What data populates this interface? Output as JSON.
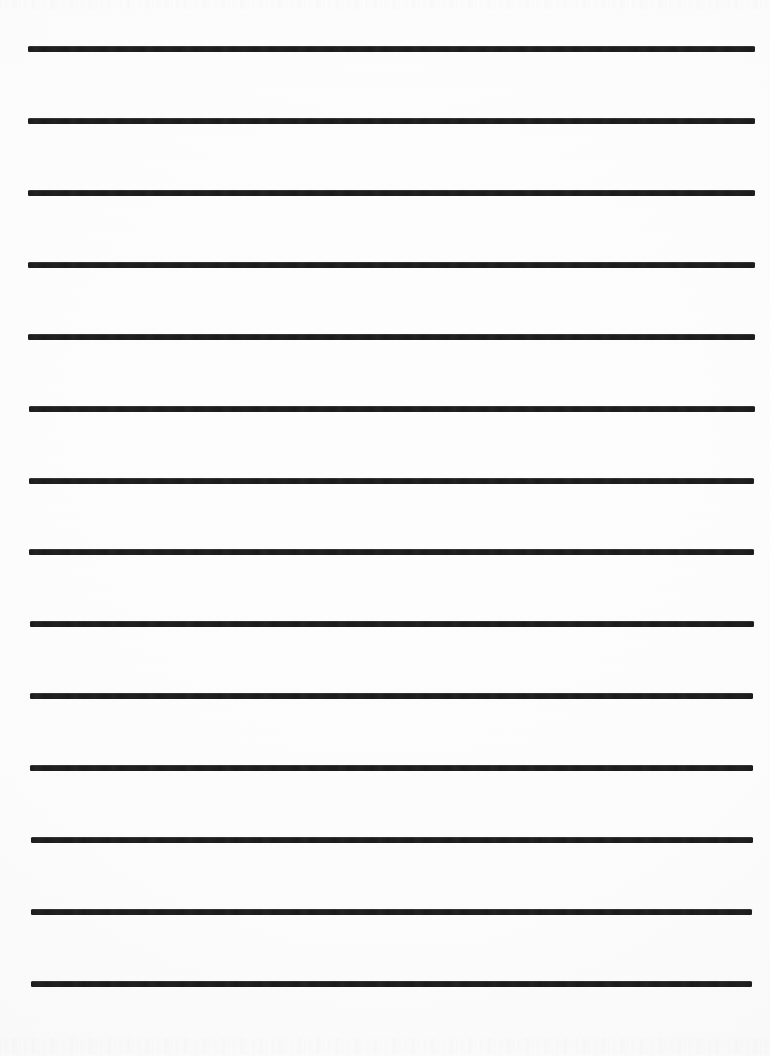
{
  "document": {
    "kind": "scanned-ruled-practice-paper",
    "title": "Ruled Practice Paper",
    "orientation": "portrait",
    "page_width": 770,
    "page_height": 1056,
    "background_color": "#fcfcfc",
    "ink_color": "#1c1c1c",
    "visible_text": "",
    "rule_count": 14,
    "rule_style": "wide-ruled solid horizontal lines",
    "rule_left_x": 28,
    "rule_right_x": 755,
    "rule_spacing_px": 72,
    "rule_thickness_px": 6
  },
  "rules": [
    {
      "index": 1,
      "label": "rule-line-1",
      "y": 46,
      "left": 28,
      "width": 727,
      "height": 6
    },
    {
      "index": 2,
      "label": "rule-line-2",
      "y": 118,
      "left": 28,
      "width": 727,
      "height": 6
    },
    {
      "index": 3,
      "label": "rule-line-3",
      "y": 190,
      "left": 28,
      "width": 727,
      "height": 6
    },
    {
      "index": 4,
      "label": "rule-line-4",
      "y": 262,
      "left": 28,
      "width": 727,
      "height": 6
    },
    {
      "index": 5,
      "label": "rule-line-5",
      "y": 334,
      "left": 28,
      "width": 727,
      "height": 6
    },
    {
      "index": 6,
      "label": "rule-line-6",
      "y": 406,
      "left": 29,
      "width": 726,
      "height": 6
    },
    {
      "index": 7,
      "label": "rule-line-7",
      "y": 478,
      "left": 29,
      "width": 725,
      "height": 6
    },
    {
      "index": 8,
      "label": "rule-line-8",
      "y": 549,
      "left": 29,
      "width": 725,
      "height": 6
    },
    {
      "index": 9,
      "label": "rule-line-9",
      "y": 621,
      "left": 30,
      "width": 724,
      "height": 6
    },
    {
      "index": 10,
      "label": "rule-line-10",
      "y": 693,
      "left": 30,
      "width": 723,
      "height": 6
    },
    {
      "index": 11,
      "label": "rule-line-11",
      "y": 765,
      "left": 30,
      "width": 723,
      "height": 6
    },
    {
      "index": 12,
      "label": "rule-line-12",
      "y": 837,
      "left": 31,
      "width": 722,
      "height": 6
    },
    {
      "index": 13,
      "label": "rule-line-13",
      "y": 909,
      "left": 31,
      "width": 721,
      "height": 6
    },
    {
      "index": 14,
      "label": "rule-line-14",
      "y": 981,
      "left": 31,
      "width": 721,
      "height": 6
    }
  ],
  "margins": {
    "top_margin_px": 46,
    "bottom_margin_px": 69,
    "left_margin_px": 28,
    "right_margin_px": 15
  }
}
